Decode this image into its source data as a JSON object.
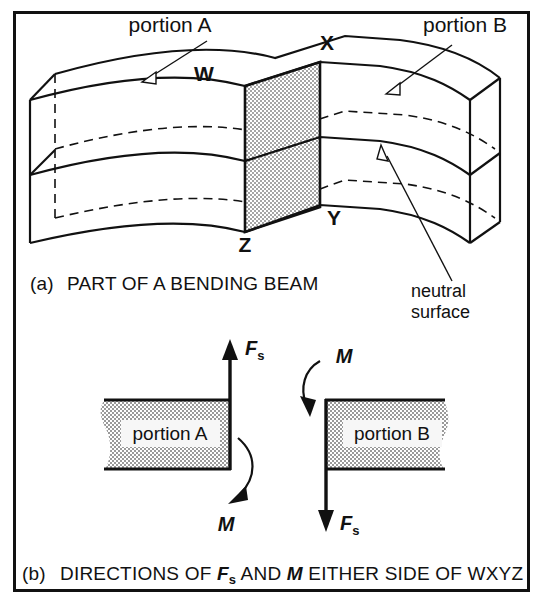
{
  "figure": {
    "frame_color": "#111111",
    "background": "#ffffff",
    "hatch_color": "#b9b9b9"
  },
  "panel_a": {
    "caption_index": "(a)",
    "caption_text": "PART OF A BENDING BEAM",
    "labels": {
      "portion_a": "portion A",
      "portion_b": "portion B",
      "neutral_line1": "neutral",
      "neutral_line2": "surface"
    },
    "vertices": {
      "w": "W",
      "x": "X",
      "y": "Y",
      "z": "Z"
    }
  },
  "panel_b": {
    "caption_index": "(b)",
    "caption_part1": "DIRECTIONS OF ",
    "caption_force": "F",
    "caption_force_sub": "s",
    "caption_part2": " AND ",
    "caption_moment": "M",
    "caption_part3": " EITHER SIDE OF WXYZ",
    "left_block": {
      "label": "portion A",
      "force_symbol": "F",
      "force_subscript": "s",
      "moment_symbol": "M"
    },
    "right_block": {
      "label": "portion B",
      "force_symbol": "F",
      "force_subscript": "s",
      "moment_symbol": "M"
    }
  }
}
